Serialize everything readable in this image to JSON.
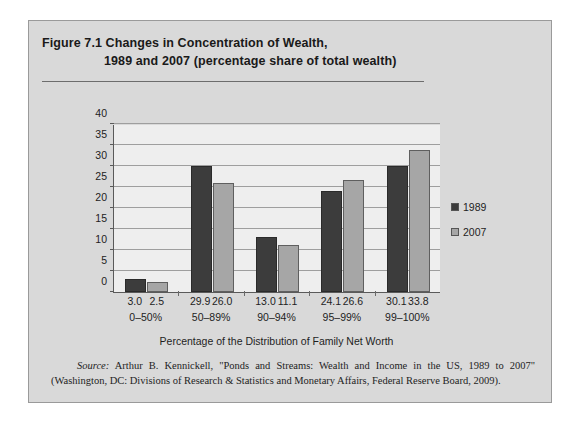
{
  "figure": {
    "title_line1": "Figure 7.1  Changes in Concentration of Wealth,",
    "title_line2": "1989 and 2007 (percentage share of total wealth)",
    "source_label": "Source:",
    "source_text": " Arthur B. Kennickell, \"Ponds and Streams: Wealth and Income in the US, 1989 to 2007\" (Washington, DC: Divisions of Research & Statistics and Monetary Affairs, Federal Reserve Board, 2009)."
  },
  "chart_data": {
    "type": "bar",
    "title": "Changes in Concentration of Wealth, 1989 and 2007 (percentage share of total wealth)",
    "xlabel": "Percentage of the Distribution of Family Net Worth",
    "ylabel": "",
    "ylim": [
      0,
      40
    ],
    "yticks": [
      0,
      5,
      10,
      15,
      20,
      25,
      30,
      35,
      40
    ],
    "ytick_labels": [
      "0",
      "5",
      "10",
      "15",
      "20",
      "25",
      "30",
      "35",
      "40"
    ],
    "grid": true,
    "legend_position": "right",
    "categories": [
      "0–50%",
      "50–89%",
      "90–94%",
      "95–99%",
      "99–100%"
    ],
    "series": [
      {
        "name": "1989",
        "color": "#3c3c3c",
        "values": [
          3.0,
          29.9,
          13.0,
          24.1,
          30.1
        ],
        "value_labels": [
          "3.0",
          "29.9",
          "13.0",
          "24.1",
          "30.1"
        ]
      },
      {
        "name": "2007",
        "color": "#a6a6a6",
        "values": [
          2.5,
          26.0,
          11.1,
          26.6,
          33.8
        ],
        "value_labels": [
          "2.5",
          "26.0",
          "11.1",
          "26.6",
          "33.8"
        ]
      }
    ]
  }
}
